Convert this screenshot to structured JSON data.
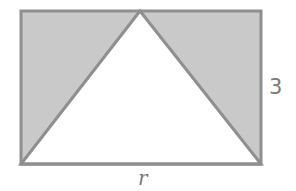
{
  "diagram": {
    "rectangle": {
      "x": 21,
      "y": 11,
      "width": 240,
      "height": 153,
      "stroke": "#8f8f8f",
      "shaded_fill": "#c9c9c9"
    },
    "triangle": {
      "points": [
        [
          21,
          164
        ],
        [
          140,
          11
        ],
        [
          261,
          164
        ]
      ],
      "fill": "#ffffff",
      "stroke": "#8f8f8f"
    },
    "labels": {
      "height": "3",
      "width": "r"
    },
    "colors": {
      "stroke": "#8f8f8f",
      "shade": "#c9c9c9",
      "text": "#7a7a7a",
      "background": "#ffffff"
    }
  }
}
